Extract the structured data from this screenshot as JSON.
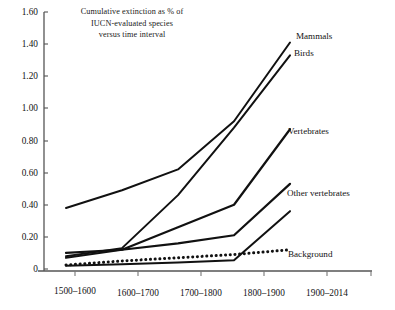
{
  "chart_data": {
    "type": "line",
    "title": "Cumulative extinction as % of IUCN-evaluated species versus time interval",
    "title_lines": [
      "Cumulative extinction as % of",
      "IUCN-evaluated species",
      "versus time interval"
    ],
    "xlabel": "",
    "ylabel": "",
    "categories": [
      "1500–1600",
      "1600–1700",
      "1700–1800",
      "1800–1900",
      "1900–2014"
    ],
    "ylim": [
      0,
      1.6
    ],
    "yticks": [
      0,
      0.2,
      0.4,
      0.6,
      0.8,
      1.0,
      1.2,
      1.4,
      1.6
    ],
    "ytick_labels": [
      "0",
      "0.20",
      "0.40",
      "0.60",
      "0.80",
      "1.00",
      "1.20",
      "1.40",
      "1.60"
    ],
    "grid": false,
    "legend_position": "inline-right-of-line-ends",
    "series": [
      {
        "name": "Mammals",
        "style": "solid",
        "values": [
          0.38,
          0.49,
          0.62,
          0.92,
          1.41
        ]
      },
      {
        "name": "Birds",
        "style": "solid",
        "values": [
          0.08,
          0.13,
          0.46,
          0.88,
          1.33
        ]
      },
      {
        "name": "Vertebrates",
        "style": "solid",
        "values": [
          0.07,
          0.12,
          0.26,
          0.4,
          0.87
        ]
      },
      {
        "name": "Other vertebrates",
        "style": "solid",
        "values": [
          0.1,
          0.12,
          0.16,
          0.21,
          0.53
        ]
      },
      {
        "name": "Background",
        "style": "dotted",
        "values": [
          0.025,
          0.05,
          0.07,
          0.09,
          0.12
        ]
      },
      {
        "name": "Lower solid baseline",
        "style": "solid",
        "values": [
          0.02,
          0.03,
          0.04,
          0.055,
          0.36
        ]
      }
    ]
  },
  "axis": {
    "y_ticks": [
      "1.60",
      "1.40",
      "1.20",
      "1.00",
      "0.80",
      "0.60",
      "0.40",
      "0.20",
      "0"
    ],
    "x_ticks": [
      "1500–1600",
      "1600–1700",
      "1700–1800",
      "1800–1900",
      "1900–2014"
    ]
  },
  "labels": {
    "mammals": "Mammals",
    "birds": "Birds",
    "vertebrates": "Vertebrates",
    "other_vertebrates": "Other vertebrates",
    "background": "Background"
  },
  "colors": {
    "line": "#111111",
    "axis": "#555555",
    "text": "#111111",
    "background": "#ffffff"
  }
}
